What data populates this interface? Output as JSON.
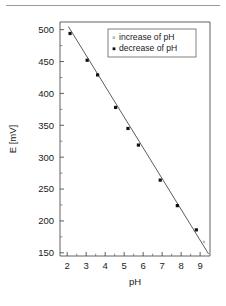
{
  "chart_data": {
    "type": "scatter",
    "title": "",
    "xlabel": "pH",
    "ylabel": "E [mV]",
    "xlim": [
      1.62,
      9.52
    ],
    "ylim": [
      145,
      512
    ],
    "xticks": [
      2,
      3,
      4,
      5,
      6,
      7,
      8,
      9
    ],
    "yticks": [
      150,
      200,
      250,
      300,
      350,
      400,
      450,
      500
    ],
    "xtick_labels": [
      "2",
      "3",
      "4",
      "5",
      "6",
      "7",
      "8",
      "9"
    ],
    "ytick_labels": [
      "150",
      "200",
      "250",
      "300",
      "350",
      "400",
      "450",
      "500"
    ],
    "minor_ticks": true,
    "grid": false,
    "legend_position": "top-right",
    "series": [
      {
        "name": "increase of pH",
        "marker": "dot",
        "color": "#b9b9b9",
        "points": [
          {
            "x": 9.2,
            "y": 167
          }
        ]
      },
      {
        "name": "decrease of pH",
        "marker": "square",
        "color": "#111111",
        "points": [
          {
            "x": 2.15,
            "y": 494
          },
          {
            "x": 3.05,
            "y": 452
          },
          {
            "x": 3.6,
            "y": 429
          },
          {
            "x": 4.55,
            "y": 378
          },
          {
            "x": 5.2,
            "y": 345
          },
          {
            "x": 5.75,
            "y": 319
          },
          {
            "x": 6.9,
            "y": 264
          },
          {
            "x": 7.8,
            "y": 224
          },
          {
            "x": 8.8,
            "y": 186
          }
        ]
      }
    ],
    "fit_line": {
      "name": "linear regression",
      "color": "#4a4a4a",
      "x_start": 2.06,
      "y_start": 505,
      "x_end": 9.45,
      "y_end": 148
    }
  },
  "legend": {
    "entries": [
      {
        "label": "increase of pH",
        "marker_color": "#b9b9b9"
      },
      {
        "label": "decrease of pH",
        "marker_color": "#111111"
      }
    ]
  },
  "axes": {
    "x_title": "pH",
    "y_title": "E [mV]"
  }
}
